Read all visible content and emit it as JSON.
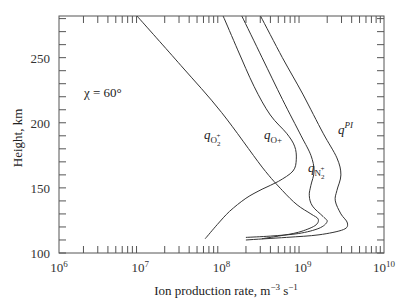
{
  "chart_data": {
    "type": "line",
    "title": "",
    "xlabel": "Ion production rate, m",
    "xlabel_sup1": "−3",
    "xlabel_mid": " s",
    "xlabel_sup2": "−1",
    "ylabel": "Height, km",
    "xscale": "log",
    "xlim": [
      1000000.0,
      10000000000.0
    ],
    "ylim": [
      100,
      282
    ],
    "x_ticks": [
      {
        "value": 1000000.0,
        "base": "10",
        "exp": "6"
      },
      {
        "value": 10000000.0,
        "base": "10",
        "exp": "7"
      },
      {
        "value": 100000000.0,
        "base": "10",
        "exp": "8"
      },
      {
        "value": 1000000000.0,
        "base": "10",
        "exp": "9"
      },
      {
        "value": 10000000000.0,
        "base": "10",
        "exp": "10"
      }
    ],
    "y_ticks": [
      100,
      150,
      200,
      250
    ],
    "y_minor_step": 10,
    "grid": false,
    "annotation": "χ = 60°",
    "series": [
      {
        "name": "q_O2+",
        "label_base": "q",
        "label_sub": "O",
        "label_subsub": "2",
        "label_subsup": "+",
        "points": [
          [
            6.96,
            282
          ],
          [
            7.5,
            244
          ],
          [
            8.0,
            208
          ],
          [
            8.5,
            166
          ],
          [
            8.75,
            148
          ],
          [
            8.93,
            137
          ],
          [
            9.1,
            130
          ],
          [
            9.19,
            126
          ],
          [
            9.15,
            121
          ],
          [
            8.95,
            116
          ],
          [
            8.7,
            113
          ],
          [
            8.5,
            111
          ]
        ]
      },
      {
        "name": "q_O+",
        "label_base": "q",
        "label_sub": "O+",
        "points": [
          [
            8.02,
            282
          ],
          [
            8.2,
            256
          ],
          [
            8.4,
            228
          ],
          [
            8.6,
            206
          ],
          [
            8.8,
            192
          ],
          [
            8.9,
            182
          ],
          [
            8.92,
            172
          ],
          [
            8.88,
            163
          ],
          [
            8.7,
            155
          ],
          [
            8.5,
            149
          ],
          [
            8.3,
            142
          ],
          [
            8.1,
            132
          ],
          [
            7.95,
            122
          ],
          [
            7.8,
            111
          ]
        ]
      },
      {
        "name": "q_N2+",
        "label_base": "q",
        "label_sub": "N",
        "label_subsub": "2",
        "label_subsup": "+",
        "points": [
          [
            8.25,
            282
          ],
          [
            8.5,
            250
          ],
          [
            8.75,
            218
          ],
          [
            8.98,
            190
          ],
          [
            9.1,
            175
          ],
          [
            9.14,
            163
          ],
          [
            9.1,
            152
          ],
          [
            9.08,
            144
          ],
          [
            9.12,
            136
          ],
          [
            9.25,
            128
          ],
          [
            9.3,
            124
          ],
          [
            9.2,
            119
          ],
          [
            8.95,
            115
          ],
          [
            8.6,
            113
          ],
          [
            8.3,
            112
          ]
        ]
      },
      {
        "name": "q_PI",
        "label_base": "q",
        "label_sup": "PI",
        "points": [
          [
            8.48,
            282
          ],
          [
            8.75,
            250
          ],
          [
            9.0,
            222
          ],
          [
            9.25,
            192
          ],
          [
            9.42,
            173
          ],
          [
            9.47,
            160
          ],
          [
            9.42,
            148
          ],
          [
            9.4,
            140
          ],
          [
            9.47,
            130
          ],
          [
            9.55,
            123
          ],
          [
            9.5,
            118
          ],
          [
            9.2,
            114
          ],
          [
            8.8,
            112
          ],
          [
            8.3,
            110
          ]
        ]
      }
    ]
  }
}
